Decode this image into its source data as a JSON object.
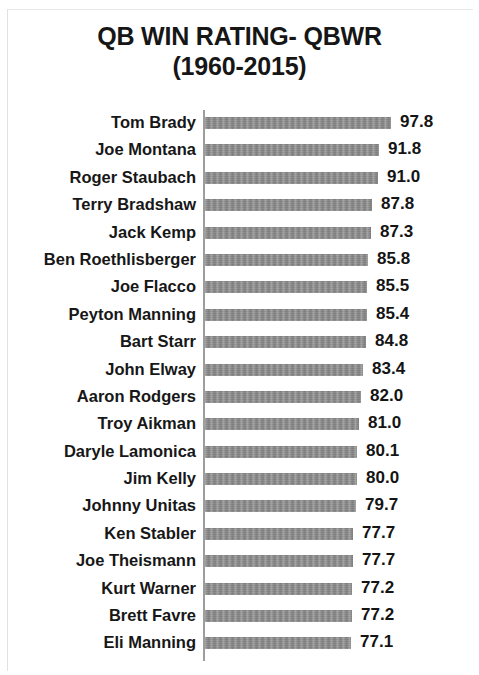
{
  "chart_data": {
    "type": "bar",
    "orientation": "horizontal",
    "title": "QB WIN RATING- QBWR (1960-2015)",
    "title_line1": "QB WIN RATING- QBWR",
    "title_line2": "(1960-2015)",
    "xlabel": "",
    "ylabel": "",
    "grid": false,
    "legend": false,
    "axis_origin_value": 0,
    "xlim": [
      0,
      100
    ],
    "value_labels_shown": true,
    "bar_color": "#8b8b8b",
    "text_color": "#161616",
    "axis_color": "#9d9d9d",
    "categories": [
      "Tom Brady",
      "Joe Montana",
      "Roger Staubach",
      "Terry Bradshaw",
      "Jack Kemp",
      "Ben Roethlisberger",
      "Joe Flacco",
      "Peyton Manning",
      "Bart Starr",
      "John Elway",
      "Aaron Rodgers",
      "Troy Aikman",
      "Daryle Lamonica",
      "Jim Kelly",
      "Johnny Unitas",
      "Ken Stabler",
      "Joe Theismann",
      "Kurt Warner",
      "Brett Favre",
      "Eli Manning"
    ],
    "values": [
      97.8,
      91.8,
      91.0,
      87.8,
      87.3,
      85.8,
      85.5,
      85.4,
      84.8,
      83.4,
      82.0,
      81.0,
      80.1,
      80.0,
      79.7,
      77.7,
      77.7,
      77.2,
      77.2,
      77.1
    ],
    "value_labels": [
      "97.8",
      "91.8",
      "91.0",
      "87.8",
      "87.3",
      "85.8",
      "85.5",
      "85.4",
      "84.8",
      "83.4",
      "82.0",
      "81.0",
      "80.1",
      "80.0",
      "79.7",
      "77.7",
      "77.7",
      "77.2",
      "77.2",
      "77.1"
    ],
    "rows": [
      {
        "label": "Tom Brady",
        "value": 97.8,
        "value_label": "97.8"
      },
      {
        "label": "Joe Montana",
        "value": 91.8,
        "value_label": "91.8"
      },
      {
        "label": "Roger Staubach",
        "value": 91.0,
        "value_label": "91.0"
      },
      {
        "label": "Terry Bradshaw",
        "value": 87.8,
        "value_label": "87.8"
      },
      {
        "label": "Jack Kemp",
        "value": 87.3,
        "value_label": "87.3"
      },
      {
        "label": "Ben Roethlisberger",
        "value": 85.8,
        "value_label": "85.8"
      },
      {
        "label": "Joe Flacco",
        "value": 85.5,
        "value_label": "85.5"
      },
      {
        "label": "Peyton Manning",
        "value": 85.4,
        "value_label": "85.4"
      },
      {
        "label": "Bart Starr",
        "value": 84.8,
        "value_label": "84.8"
      },
      {
        "label": "John Elway",
        "value": 83.4,
        "value_label": "83.4"
      },
      {
        "label": "Aaron Rodgers",
        "value": 82.0,
        "value_label": "82.0"
      },
      {
        "label": "Troy Aikman",
        "value": 81.0,
        "value_label": "81.0"
      },
      {
        "label": "Daryle Lamonica",
        "value": 80.1,
        "value_label": "80.1"
      },
      {
        "label": "Jim Kelly",
        "value": 80.0,
        "value_label": "80.0"
      },
      {
        "label": "Johnny Unitas",
        "value": 79.7,
        "value_label": "79.7"
      },
      {
        "label": "Ken Stabler",
        "value": 77.7,
        "value_label": "77.7"
      },
      {
        "label": "Joe Theismann",
        "value": 77.7,
        "value_label": "77.7"
      },
      {
        "label": "Kurt Warner",
        "value": 77.2,
        "value_label": "77.2"
      },
      {
        "label": "Brett Favre",
        "value": 77.2,
        "value_label": "77.2"
      },
      {
        "label": "Eli Manning",
        "value": 77.1,
        "value_label": "77.1"
      }
    ]
  },
  "render": {
    "plot_left_px": 205,
    "px_per_unit": 1.9,
    "value_gap_px": 9
  }
}
